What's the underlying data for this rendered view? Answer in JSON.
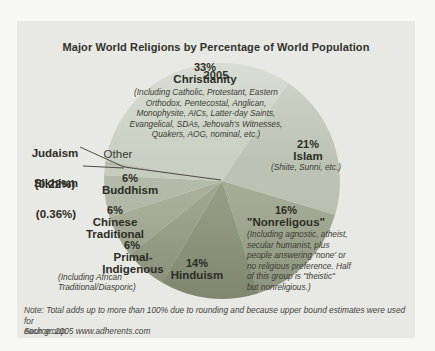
{
  "page": {
    "background_color": "#f7f7f4",
    "panel_color": "#e8e8e4"
  },
  "title": {
    "line1": "Major World Religions by Percentage of World Population",
    "line2": "2005"
  },
  "chart_data": {
    "type": "pie",
    "title": "Major World Religions by Percentage of World Population 2005",
    "unit": "percent of world population",
    "legend_position": "labels-on-chart",
    "slices": [
      {
        "id": "christianity",
        "name": "Christianity",
        "pct": "33%",
        "value": 33,
        "color": "#c9cfc2",
        "note": "(Including Catholic, Protestant, Eastern\nOrthodox, Pentecostal, Anglican,\nMonophysite, AICs, Latter-day Saints,\nEvangelical, SDAs, Jehovah's Witnesses,\nQuakers, AOG, nominal, etc.)"
      },
      {
        "id": "islam",
        "name": "Islam",
        "pct": "21%",
        "value": 21,
        "color": "#bcc3b4",
        "note": "(Shiite, Sunni, etc.)"
      },
      {
        "id": "nonreligious",
        "name": "\"Nonreligous\"",
        "pct": "16%",
        "value": 16,
        "color": "#a4ab95",
        "note": "(Including agnostic, atheist,\nsecular humanist, plus\npeople answering 'none' or\nno religious preference. Half\nof this group is \"theistic\"\nbut nonreligious.)"
      },
      {
        "id": "hinduism",
        "name": "Hinduism",
        "pct": "14%",
        "value": 14,
        "color": "#949b83"
      },
      {
        "id": "primal-indigenous",
        "name": "Primal-\nIndigenous",
        "pct": "6%",
        "value": 6,
        "color": "#9ea48e",
        "note": "(Including African\nTraditional/Diasporic)"
      },
      {
        "id": "chinese-traditional",
        "name": "Chinese\nTraditional",
        "pct": "6%",
        "value": 6,
        "color": "#a9af9a"
      },
      {
        "id": "buddhism",
        "name": "Buddhism",
        "pct": "6%",
        "value": 6,
        "color": "#b4baa8"
      },
      {
        "id": "other",
        "name": "Other",
        "pct": "",
        "value": 1.5,
        "color": "#c6ccbb"
      },
      {
        "id": "sikhism",
        "name": "Sikhism",
        "pct": "(0.36%)",
        "value": 0.36,
        "color": "#b0b6a4"
      },
      {
        "id": "judaism",
        "name": "Judaism",
        "pct": "(0.22%)",
        "value": 0.22,
        "color": "#bcc2b0"
      }
    ]
  },
  "footer": {
    "note": "Note: Total adds up to more than 100% due to rounding and because upper bound estimates were used for\neach group.",
    "source": "Source: 2005 www.adherents.com"
  }
}
